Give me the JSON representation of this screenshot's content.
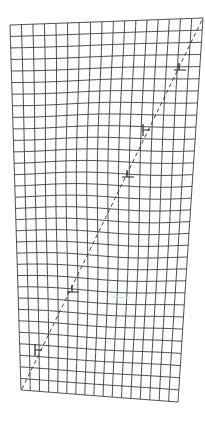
{
  "diagram": {
    "grid": {
      "columns": 17,
      "rows": 32,
      "corners": {
        "top_left": [
          10,
          25
        ],
        "top_right": [
          203,
          18
        ],
        "bottom_right": [
          178,
          402
        ],
        "bottom_left": [
          21,
          390
        ]
      },
      "line_color": "#3a3a3a"
    },
    "slip_line": {
      "start": [
        22,
        389
      ],
      "end": [
        202,
        20
      ],
      "style": "dashed",
      "color": "#333333"
    },
    "dislocations": [
      {
        "symbol": "perpendicular-up",
        "x": 180,
        "y": 70
      },
      {
        "symbol": "perpendicular-left",
        "x": 143,
        "y": 130
      },
      {
        "symbol": "perpendicular-up",
        "x": 128,
        "y": 177
      },
      {
        "symbol": "perpendicular-up",
        "x": 73,
        "y": 292
      },
      {
        "symbol": "perpendicular-left",
        "x": 35,
        "y": 350
      }
    ],
    "accent_mark": {
      "from": [
        112,
        297
      ],
      "to": [
        130,
        298
      ],
      "color": "#bfe9ee"
    }
  }
}
